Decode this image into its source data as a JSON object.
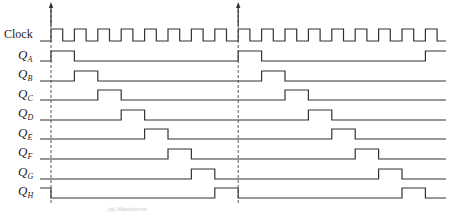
{
  "diagram": {
    "type": "timing-diagram",
    "signals": [
      {
        "id": "clock",
        "label": "Clock",
        "sub": ""
      },
      {
        "id": "qa",
        "label": "Q",
        "sub": "A"
      },
      {
        "id": "qb",
        "label": "Q",
        "sub": "B"
      },
      {
        "id": "qc",
        "label": "Q",
        "sub": "C"
      },
      {
        "id": "qd",
        "label": "Q",
        "sub": "D"
      },
      {
        "id": "qe",
        "label": "Q",
        "sub": "E"
      },
      {
        "id": "qf",
        "label": "Q",
        "sub": "F"
      },
      {
        "id": "qg",
        "label": "Q",
        "sub": "G"
      },
      {
        "id": "qh",
        "label": "Q",
        "sub": "H"
      }
    ],
    "clock_periods_per_cycle": 8,
    "cycles_shown": 2,
    "markers": [
      "cycle-start-1",
      "cycle-start-2"
    ],
    "caption": "(a) Waveforms"
  },
  "colors": {
    "line": "#333333",
    "background": "#ffffff",
    "dashed": "#444444"
  }
}
